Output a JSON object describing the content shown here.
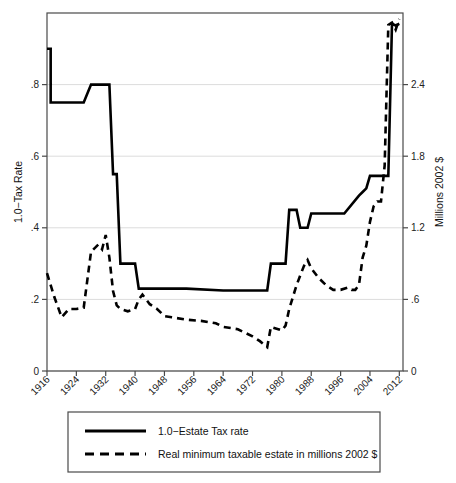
{
  "chart_data": {
    "type": "line",
    "title": "",
    "xlabel": "",
    "ylabel": "1.0−Tax Rate",
    "y2label": "Millions 2002 $",
    "xlim": [
      1916,
      2013
    ],
    "ylim": [
      0,
      1.0
    ],
    "y2lim": [
      0,
      3.0
    ],
    "grid": true,
    "grid_axis": "y",
    "legend_position": "below-plot",
    "xticks": [
      1916,
      1924,
      1932,
      1940,
      1948,
      1956,
      1964,
      1972,
      1980,
      1988,
      1996,
      2004,
      2012
    ],
    "xtick_labels": [
      "1916",
      "1924",
      "1932",
      "1940",
      "1948",
      "1956",
      "1964",
      "1972",
      "1980",
      "1988",
      "1996",
      "2004",
      "2012"
    ],
    "yticks": [
      0,
      0.2,
      0.4,
      0.6,
      0.8
    ],
    "ytick_labels": [
      "0",
      ".2",
      ".4",
      ".6",
      ".8"
    ],
    "y2ticks": [
      0,
      0.6,
      1.2,
      1.8,
      2.4
    ],
    "y2tick_labels": [
      "0",
      ".6",
      "1.2",
      "1.8",
      "2.4"
    ],
    "series": [
      {
        "name": "1.0−Estate Tax rate",
        "axis": "left",
        "style": "solid",
        "color": "#000000",
        "width": 2.6,
        "points": [
          [
            1916,
            0.9
          ],
          [
            1917,
            0.9
          ],
          [
            1917,
            0.75
          ],
          [
            1924,
            0.75
          ],
          [
            1926,
            0.75
          ],
          [
            1928,
            0.8
          ],
          [
            1932,
            0.8
          ],
          [
            1933,
            0.8
          ],
          [
            1934,
            0.55
          ],
          [
            1935,
            0.55
          ],
          [
            1936,
            0.3
          ],
          [
            1940,
            0.3
          ],
          [
            1941,
            0.23
          ],
          [
            1942,
            0.23
          ],
          [
            1954,
            0.23
          ],
          [
            1964,
            0.225
          ],
          [
            1972,
            0.225
          ],
          [
            1976,
            0.225
          ],
          [
            1977,
            0.3
          ],
          [
            1981,
            0.3
          ],
          [
            1982,
            0.45
          ],
          [
            1984,
            0.45
          ],
          [
            1985,
            0.4
          ],
          [
            1987,
            0.4
          ],
          [
            1988,
            0.44
          ],
          [
            1992,
            0.44
          ],
          [
            1997,
            0.44
          ],
          [
            2001,
            0.49
          ],
          [
            2002,
            0.5
          ],
          [
            2003,
            0.51
          ],
          [
            2004,
            0.545
          ],
          [
            2007,
            0.545
          ],
          [
            2009,
            0.545
          ],
          [
            2010,
            0.97
          ],
          [
            2011,
            0.965
          ],
          [
            2012,
            0.97
          ]
        ]
      },
      {
        "name": "Real minimum taxable estate in millions 2002 $",
        "axis": "right",
        "style": "dashed",
        "color": "#000000",
        "width": 2.6,
        "points": [
          [
            1916,
            0.82
          ],
          [
            1918,
            0.62
          ],
          [
            1920,
            0.45
          ],
          [
            1922,
            0.52
          ],
          [
            1924,
            0.52
          ],
          [
            1926,
            0.53
          ],
          [
            1928,
            1.0
          ],
          [
            1930,
            1.06
          ],
          [
            1931,
            1.02
          ],
          [
            1932,
            1.14
          ],
          [
            1933,
            0.95
          ],
          [
            1934,
            0.67
          ],
          [
            1935,
            0.55
          ],
          [
            1936,
            0.52
          ],
          [
            1938,
            0.5
          ],
          [
            1940,
            0.52
          ],
          [
            1941,
            0.6
          ],
          [
            1942,
            0.64
          ],
          [
            1944,
            0.56
          ],
          [
            1946,
            0.52
          ],
          [
            1948,
            0.46
          ],
          [
            1950,
            0.45
          ],
          [
            1954,
            0.43
          ],
          [
            1958,
            0.42
          ],
          [
            1962,
            0.4
          ],
          [
            1964,
            0.37
          ],
          [
            1968,
            0.35
          ],
          [
            1970,
            0.32
          ],
          [
            1972,
            0.29
          ],
          [
            1974,
            0.25
          ],
          [
            1976,
            0.2
          ],
          [
            1977,
            0.37
          ],
          [
            1979,
            0.35
          ],
          [
            1980,
            0.34
          ],
          [
            1981,
            0.38
          ],
          [
            1982,
            0.52
          ],
          [
            1984,
            0.72
          ],
          [
            1986,
            0.88
          ],
          [
            1987,
            0.93
          ],
          [
            1988,
            0.86
          ],
          [
            1990,
            0.78
          ],
          [
            1992,
            0.72
          ],
          [
            1994,
            0.68
          ],
          [
            1996,
            0.68
          ],
          [
            1998,
            0.7
          ],
          [
            1999,
            0.68
          ],
          [
            2000,
            0.68
          ],
          [
            2001,
            0.72
          ],
          [
            2002,
            0.95
          ],
          [
            2003,
            1.05
          ],
          [
            2004,
            1.25
          ],
          [
            2005,
            1.38
          ],
          [
            2006,
            1.42
          ],
          [
            2007,
            1.42
          ],
          [
            2008,
            1.72
          ],
          [
            2009,
            2.9
          ],
          [
            2010,
            2.92
          ],
          [
            2011,
            2.86
          ],
          [
            2012,
            2.95
          ]
        ]
      }
    ],
    "legend_entries": [
      {
        "label": "1.0−Estate Tax rate",
        "style": "solid"
      },
      {
        "label": "Real minimum taxable estate in millions 2002 $",
        "style": "dashed"
      }
    ]
  }
}
